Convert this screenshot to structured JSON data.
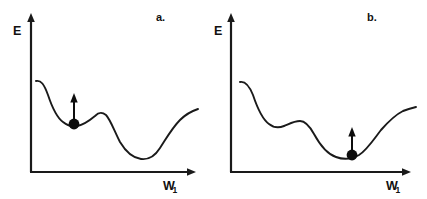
{
  "figure": {
    "width": 427,
    "height": 199,
    "background": "#ffffff",
    "ink_color": "#1a1a1a"
  },
  "panels": [
    {
      "id": "panel-a",
      "label": "a.",
      "label_x": 156,
      "label_y": 21,
      "y_axis_label": "E",
      "x_axis_label": "W",
      "x_axis_subscript": "1",
      "y_label_x": 13,
      "y_label_y": 35,
      "x_label_x": 163,
      "x_label_y": 190,
      "x_sub_x": 173,
      "x_sub_y": 193,
      "axes": {
        "origin_x": 31,
        "origin_y": 172,
        "x_end": 196,
        "y_top": 14
      },
      "curve": "M 36,81 C 41,80 44,84 48,95 C 52,107 56,117 63,122 C 68,126 72,127 77,126 C 84,125 89,121 95,116 C 99,112 102,112 106,115 C 110,119 114,130 120,142 C 126,152 133,158 141,159 C 149,160 155,156 160,148 C 166,139 172,128 180,120 C 186,114 192,111 198,109",
      "ball": {
        "cx": 74,
        "cy": 124,
        "r": 5.4
      },
      "arrow": {
        "x": 74,
        "y_base": 123,
        "y_tip": 94,
        "head_half_width": 3.6,
        "head_height": 8
      }
    },
    {
      "id": "panel-b",
      "label": "b.",
      "label_x": 367,
      "label_y": 21,
      "y_axis_label": "E",
      "x_axis_label": "W",
      "x_axis_subscript": "1",
      "y_label_x": 214,
      "y_label_y": 35,
      "x_label_x": 386,
      "x_label_y": 190,
      "x_sub_x": 396,
      "x_sub_y": 193,
      "axes": {
        "origin_x": 231,
        "origin_y": 172,
        "x_end": 411,
        "y_top": 14
      },
      "curve": "M 240,82 C 245,81 249,85 253,95 C 257,107 262,119 269,124 C 274,128 279,128 284,126 C 289,124 294,121 300,121 C 305,121 309,125 314,134 C 320,145 327,154 336,157 C 344,160 352,159 359,155 C 367,150 374,139 381,130 C 388,122 395,115 403,111 C 408,109 412,108 416,107",
      "ball": {
        "cx": 352,
        "cy": 155,
        "r": 5.4
      },
      "arrow": {
        "x": 352,
        "y_base": 154,
        "y_tip": 128,
        "head_half_width": 3.6,
        "head_height": 8
      }
    }
  ]
}
